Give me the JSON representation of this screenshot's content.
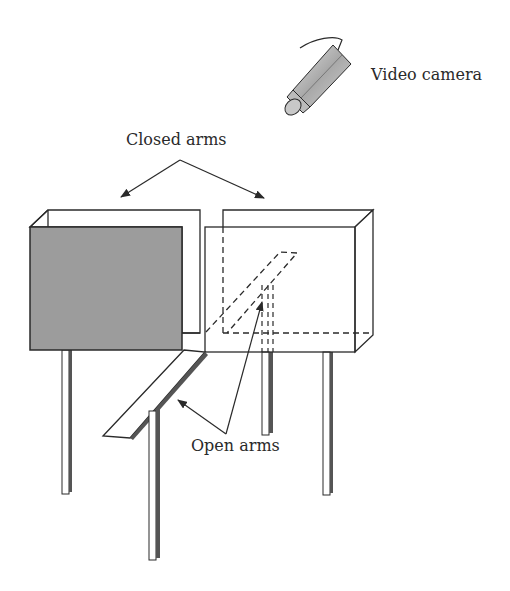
{
  "figure": {
    "type": "elevated plus maze apparatus schematic",
    "labels": {
      "camera": "Video camera",
      "closed_arms": "Closed arms",
      "open_arms": "Open arms"
    },
    "colors": {
      "stroke": "#2a2a2a",
      "closed_wall_fill": "#9c9c9c",
      "leg_shadow": "#555555",
      "background": "#ffffff",
      "camera_body": "#b5b5b5"
    },
    "components": [
      "video-camera",
      "closed-arm-left",
      "closed-arm-right",
      "open-arm-front",
      "open-arm-back-hidden",
      "legs"
    ]
  }
}
